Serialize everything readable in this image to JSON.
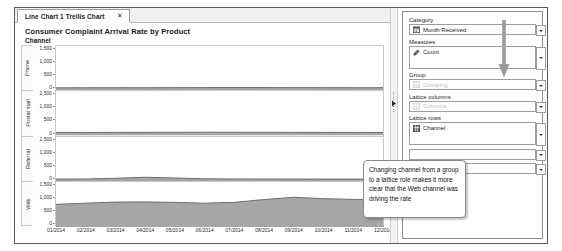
{
  "tab": {
    "label": "Line Chart 1 Trellis Chart",
    "close_icon": "close-icon"
  },
  "chart": {
    "title": "Consumer Complaint Arrival Rate by Product",
    "lattice_header": "Channel"
  },
  "roles": {
    "category": {
      "label": "Category",
      "value": "Month Received",
      "icon": "calendar-icon",
      "empty": false
    },
    "measures": {
      "label": "Measures",
      "value": "Count",
      "icon": "ruler-icon",
      "empty": false
    },
    "group": {
      "label": "Group",
      "value": "Grouping",
      "icon": "grid-icon",
      "empty": true
    },
    "lattice_columns": {
      "label": "Lattice columns",
      "value": "Columns",
      "icon": "grid-icon",
      "empty": true
    },
    "lattice_rows": {
      "label": "Lattice rows",
      "value": "Channel",
      "icon": "grid-icon",
      "empty": false
    },
    "extra1": {
      "label": "",
      "value": "",
      "empty": true
    },
    "extra2": {
      "label": "",
      "value": "",
      "empty": true
    }
  },
  "callout": {
    "text": "Changing channel from a group to a lattice role makes it more clear that the Web channel was driving the rate"
  },
  "chart_data": {
    "type": "area",
    "title": "Consumer Complaint Arrival Rate by Product",
    "xlabel": "",
    "ylabel": "Count",
    "ylim": [
      0,
      1500
    ],
    "yticks": [
      1500,
      1000,
      500,
      0
    ],
    "grid": false,
    "legend": "none",
    "lattice_variable": "Channel",
    "x": [
      "01/2014",
      "02/2014",
      "03/2014",
      "04/2014",
      "05/2014",
      "06/2014",
      "07/2014",
      "08/2014",
      "09/2014",
      "10/2014",
      "11/2014",
      "12/2014"
    ],
    "panels": [
      {
        "name": "Phone",
        "values": [
          40,
          42,
          45,
          44,
          46,
          48,
          50,
          49,
          47,
          46,
          45,
          44
        ]
      },
      {
        "name": "Postal mail",
        "values": [
          55,
          54,
          58,
          57,
          60,
          62,
          61,
          59,
          58,
          57,
          55,
          54
        ]
      },
      {
        "name": "Referral",
        "values": [
          30,
          33,
          60,
          95,
          70,
          40,
          34,
          32,
          31,
          30,
          30,
          29
        ]
      },
      {
        "name": "Web",
        "values": [
          760,
          800,
          840,
          845,
          830,
          800,
          830,
          930,
          1010,
          960,
          935,
          905
        ]
      }
    ]
  }
}
